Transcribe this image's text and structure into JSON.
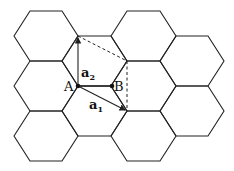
{
  "diagram": {
    "colors": {
      "line": "#222222",
      "background": "#ffffff"
    },
    "hexagon_side_px": 32,
    "points": {
      "A": {
        "label": "A",
        "x": 78,
        "y": 86
      },
      "B": {
        "label": "B",
        "x": 112,
        "y": 86
      }
    },
    "vectors": [
      {
        "name": "a1",
        "label": "a",
        "subscript": "1",
        "from": "A",
        "to": [
          127,
          111
        ]
      },
      {
        "name": "a2",
        "label": "a",
        "subscript": "2",
        "from": "A",
        "to": [
          78,
          36
        ]
      }
    ],
    "dashed_lines": [
      {
        "from": [
          78,
          36
        ],
        "to": [
          127,
          61
        ]
      },
      {
        "from": [
          127,
          61
        ],
        "to": [
          127,
          111
        ]
      }
    ]
  }
}
